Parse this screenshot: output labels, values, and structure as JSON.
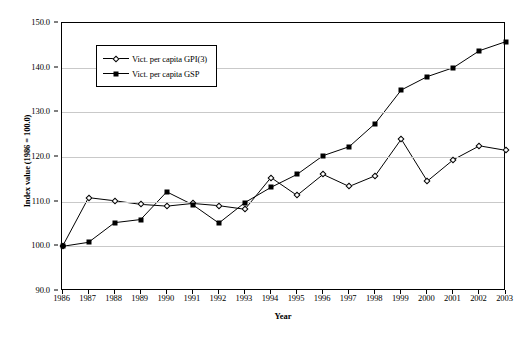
{
  "chart_data": {
    "type": "line",
    "title": "",
    "xlabel": "Year",
    "ylabel": "Index value (1986 = 100.0)",
    "x": [
      1986,
      1987,
      1988,
      1989,
      1990,
      1991,
      1992,
      1993,
      1994,
      1995,
      1996,
      1997,
      1998,
      1999,
      2000,
      2001,
      2002,
      2003
    ],
    "categories": [
      "1986",
      "1987",
      "1988",
      "1989",
      "1990",
      "1991",
      "1992",
      "1993",
      "1994",
      "1995",
      "1996",
      "1997",
      "1998",
      "1999",
      "2000",
      "2001",
      "2002",
      "2003"
    ],
    "xlim": [
      1986,
      2003
    ],
    "ylim": [
      90.0,
      150.0
    ],
    "yticks": [
      "90.0",
      "100.0",
      "110.0",
      "120.0",
      "130.0",
      "140.0",
      "150.0"
    ],
    "ytick_values": [
      90.0,
      100.0,
      110.0,
      120.0,
      130.0,
      140.0,
      150.0
    ],
    "grid": true,
    "legend_position": "upper left inside",
    "series": [
      {
        "name": "Vict. per capita GPI(3)",
        "marker": "open-diamond",
        "values": [
          100.0,
          110.9,
          110.2,
          109.4,
          109.0,
          109.6,
          109.1,
          108.3,
          115.4,
          111.4,
          116.1,
          113.4,
          115.8,
          124.0,
          114.6,
          119.4,
          122.5,
          121.5
        ]
      },
      {
        "name": "Vict. per capita GSP",
        "marker": "filled-square",
        "values": [
          100.0,
          100.9,
          105.3,
          106.0,
          112.2,
          109.3,
          105.2,
          109.8,
          113.2,
          116.1,
          120.3,
          122.3,
          127.5,
          135.0,
          138.0,
          140.0,
          143.8,
          145.8
        ]
      }
    ]
  }
}
